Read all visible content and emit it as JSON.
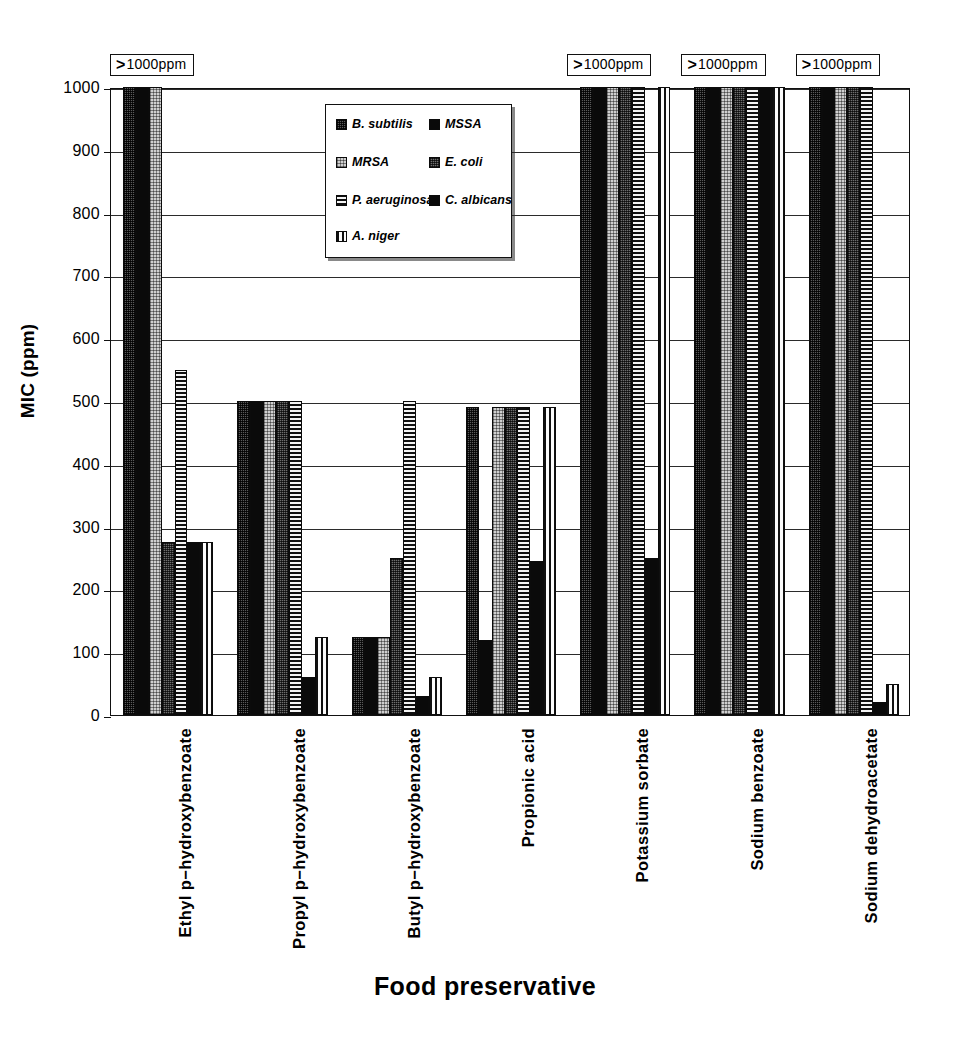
{
  "chart_data": {
    "type": "bar",
    "title": "",
    "xlabel": "Food preservative",
    "ylabel": "MIC (ppm)",
    "ylim": [
      0,
      1000
    ],
    "yticks": [
      0,
      100,
      200,
      300,
      400,
      500,
      600,
      700,
      800,
      900,
      1000
    ],
    "ytick_labels": [
      "0",
      "100",
      "200",
      "300",
      "400",
      "500",
      "600",
      "700",
      "800",
      "900",
      "1000"
    ],
    "grid": true,
    "legend_position": "upper-left-inside",
    "categories": [
      "Ethyl p−hydroxybenzoate",
      "Propyl p−hydroxybenzoate",
      "Butyl p−hydroxybenzoate",
      "Propionic acid",
      "Potassium sorbate",
      "Sodium benzoate",
      "Sodium dehydroacetate"
    ],
    "series": [
      {
        "name": "B. subtilis",
        "pattern": "stipple-dark",
        "values": [
          1000,
          500,
          125,
          490,
          1000,
          1000,
          1000
        ],
        "censored": [
          true,
          false,
          false,
          false,
          true,
          true,
          true
        ]
      },
      {
        "name": "MSSA",
        "pattern": "solid-black",
        "values": [
          1000,
          500,
          125,
          120,
          1000,
          1000,
          1000
        ],
        "censored": [
          true,
          false,
          false,
          false,
          true,
          true,
          true
        ]
      },
      {
        "name": "MRSA",
        "pattern": "stipple-light",
        "values": [
          1000,
          500,
          125,
          490,
          1000,
          1000,
          1000
        ],
        "censored": [
          true,
          false,
          false,
          false,
          true,
          true,
          true
        ]
      },
      {
        "name": "E. coli",
        "pattern": "stipple-med",
        "values": [
          275,
          500,
          250,
          490,
          1000,
          1000,
          1000
        ],
        "censored": [
          false,
          false,
          false,
          false,
          true,
          true,
          true
        ]
      },
      {
        "name": "P. aeruginosa",
        "pattern": "hlines",
        "values": [
          550,
          500,
          500,
          490,
          1000,
          1000,
          1000
        ],
        "censored": [
          false,
          false,
          false,
          false,
          true,
          true,
          true
        ]
      },
      {
        "name": "C. albicans",
        "pattern": "solid-black",
        "values": [
          275,
          60,
          30,
          245,
          250,
          1000,
          20
        ],
        "censored": [
          false,
          false,
          false,
          false,
          false,
          true,
          false
        ]
      },
      {
        "name": "A. niger",
        "pattern": "vlines",
        "values": [
          275,
          125,
          60,
          490,
          1000,
          1000,
          50
        ],
        "censored": [
          false,
          false,
          false,
          false,
          true,
          true,
          false
        ]
      }
    ],
    "annotations": [
      {
        "text": ">1000ppm",
        "category_index": 0
      },
      {
        "text": ">1000ppm",
        "category_index": 4
      },
      {
        "text": ">1000ppm",
        "category_index": 5
      },
      {
        "text": ">1000ppm",
        "category_index": 6
      }
    ]
  },
  "legend": {
    "entries": [
      {
        "label": "B. subtilis",
        "pattern": "stipple-dark"
      },
      {
        "label": "MSSA",
        "pattern": "solid-black"
      },
      {
        "label": "MRSA",
        "pattern": "stipple-light"
      },
      {
        "label": "E. coli",
        "pattern": "stipple-med"
      },
      {
        "label": "P. aeruginosa",
        "pattern": "hlines"
      },
      {
        "label": "C. albicans",
        "pattern": "solid-black"
      },
      {
        "label": "A. niger",
        "pattern": "vlines"
      }
    ]
  },
  "colors": {
    "axis": "#111111",
    "grid": "#2b2b2b",
    "background": "#ffffff"
  }
}
